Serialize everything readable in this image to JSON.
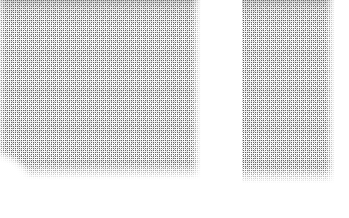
{
  "canvas": {
    "width": 349,
    "height": 218,
    "background_color": "#ffffff",
    "description": "Scanned document fragment rendered as dithered halftone stipple, two separated text blocks on white"
  },
  "palette": {
    "background": "#ffffff",
    "stipple_dark": "#505050",
    "stipple_mid": "#969696",
    "stipple_light": "#c8c8c8"
  },
  "blocks": [
    {
      "id": "block-left",
      "name": "Left text block",
      "x": 0,
      "y": 0,
      "width": 201,
      "height": 179,
      "shape": "rectangle with concave bite at bottom-left corner",
      "cropped_at_top": true,
      "top_band": true,
      "bottom_fade": true
    },
    {
      "id": "block-right",
      "name": "Right text block",
      "x": 242,
      "y": 0,
      "width": 93,
      "height": 183,
      "shape": "rectangle",
      "cropped_at_top": true,
      "top_band": true,
      "bottom_fade": true
    }
  ],
  "gutter": {
    "name": "Column gutter",
    "x": 201,
    "width": 41,
    "color": "#ffffff"
  },
  "margins": {
    "bottom_white_strip_y": 183,
    "right_white_strip_x": 335
  }
}
